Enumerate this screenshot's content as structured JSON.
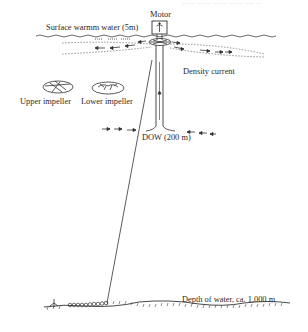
{
  "diagram": {
    "type": "schematic",
    "top_caption_faint": "─── ─── ─── ─── ── ─",
    "labels": {
      "motor": "Motor",
      "surface_water": "Surface warmm water (5m)",
      "density_current": "Density current",
      "upper_impeller": "Upper impeller",
      "lower_impeller": "Lower impeller",
      "dow": "DOW (200 m)",
      "depth": "Depth of water, ca. 1,000 m"
    },
    "components": [
      "motor",
      "vertical-pipe",
      "upper-impeller",
      "lower-impeller",
      "mooring-line",
      "anchor-chain",
      "seabed",
      "sea-surface",
      "density-current-flow-arrows",
      "intake-flow-arrows"
    ],
    "colors": {
      "line": "#333333",
      "background": "#ffffff",
      "dashed": "#555555"
    }
  }
}
